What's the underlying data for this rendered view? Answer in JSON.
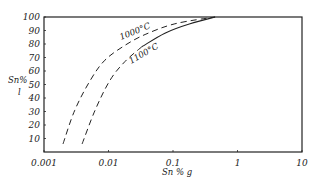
{
  "chart_data": {
    "type": "line",
    "title": "",
    "xlabel": "Sn % g",
    "ylabel": "Sn % l",
    "xscale": "log",
    "xlim": [
      0.001,
      10
    ],
    "ylim": [
      0,
      100
    ],
    "x_ticks": [
      "0.001",
      "0.01",
      "0.1",
      "1",
      "10"
    ],
    "y_ticks": [
      "10",
      "20",
      "30",
      "40",
      "50",
      "60",
      "70",
      "80",
      "90",
      "100"
    ],
    "grid": false,
    "legend": "inline curve labels",
    "series": [
      {
        "name": "1000°C",
        "style": "dashed",
        "x": [
          0.00197,
          0.003,
          0.0052,
          0.0088,
          0.018,
          0.037,
          0.107,
          0.45
        ],
        "y": [
          6,
          31,
          53,
          68,
          79,
          87,
          95,
          100
        ]
      },
      {
        "name": "1100°C",
        "style": "dashed lower, solid upper",
        "x": [
          0.0039,
          0.0062,
          0.0105,
          0.018,
          0.033,
          0.075,
          0.184,
          0.45
        ],
        "y": [
          6,
          31,
          53,
          67,
          78,
          88,
          95,
          100
        ]
      }
    ]
  },
  "labels": {
    "ylabel_top": "Sn%",
    "ylabel_bottom": "l",
    "xlabel": "Sn % g",
    "curve_1000": "1000°C",
    "curve_1100": "1100°C"
  }
}
